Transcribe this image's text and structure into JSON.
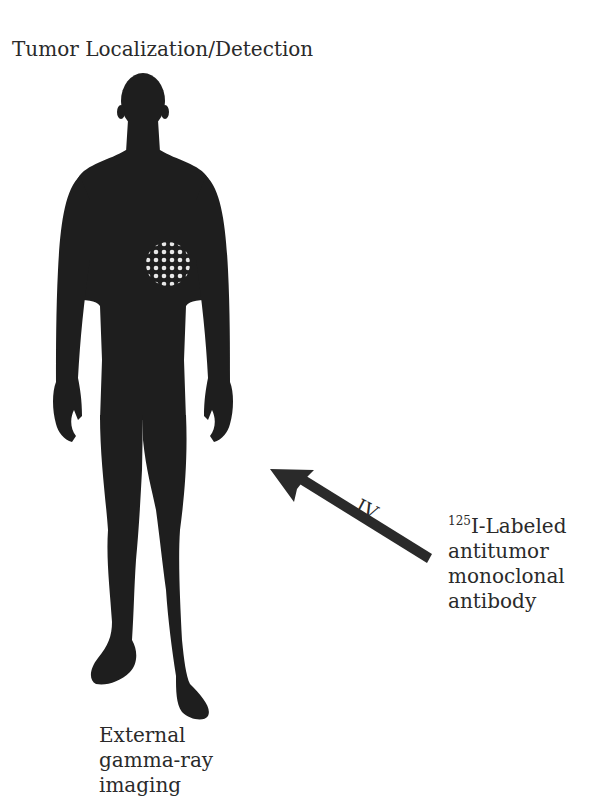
{
  "title": "Tumor Localization/Detection",
  "route_label": "IV",
  "agent": {
    "isotope_mass": "125",
    "line1_rest": "I-Labeled",
    "line2": "antitumor",
    "line3": "monoclonal",
    "line4": "antibody"
  },
  "imaging": {
    "line1": "External",
    "line2": "gamma-ray",
    "line3": "imaging"
  },
  "colors": {
    "silhouette": "#1e1e1e",
    "arrow": "#2a2a2a",
    "tumor_dots": "#e6e6e6",
    "text": "#2a2a2a"
  }
}
